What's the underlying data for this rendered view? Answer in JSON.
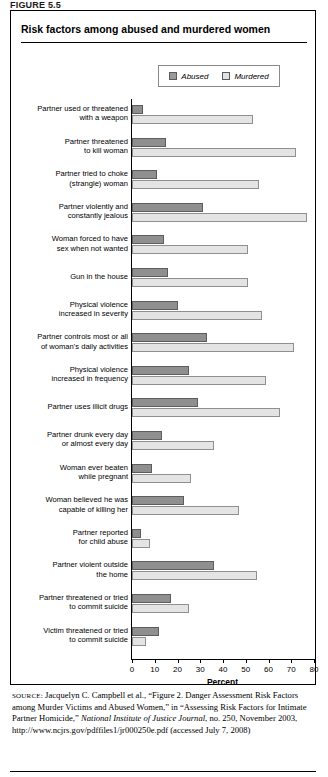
{
  "figure_label": "FIGURE 5.5",
  "title": "Risk factors among abused and murdered women",
  "legend": {
    "items": [
      {
        "label": "Abused",
        "color": "#8f8f8f",
        "name": "abused"
      },
      {
        "label": "Murdered",
        "color": "#e4e4e4",
        "name": "murdered"
      }
    ]
  },
  "source": {
    "prefix": "SOURCE:",
    "part1": " Jacquelyn C. Campbell et al., “Figure 2. Danger Assessment Risk Factors among Murder Victims and Abused Women,” in “Assessing Risk Factors for Intimate Partner Homicide,” ",
    "italic1": "National Institute of Justice Journal",
    "part2": ", no. 250, November 2003, http://www.ncjrs.gov/pdffiles1/jr000250e.pdf (accessed July 7, 2008)"
  },
  "chart_data": {
    "type": "bar",
    "orientation": "horizontal",
    "title": "Risk factors among abused and murdered women",
    "xlabel": "Percent",
    "ylabel": "",
    "xlim": [
      0,
      80
    ],
    "xticks": [
      0,
      10,
      20,
      30,
      40,
      50,
      60,
      70,
      80
    ],
    "grid": false,
    "legend_position": "top-right",
    "categories": [
      "Partner used or threatened with a weapon",
      "Partner threatened to kill woman",
      "Partner tried to choke (strangle) woman",
      "Partner violently and constantly jealous",
      "Woman forced to have sex when not wanted",
      "Gun in the house",
      "Physical violence increased in severity",
      "Partner controls most or all of woman's daily activities",
      "Physical violence increased in frequency",
      "Partner uses illicit drugs",
      "Partner drunk every day or almost every day",
      "Woman ever beaten while pregnant",
      "Woman believed he was capable of killing her",
      "Partner reported for child abuse",
      "Partner violent outside the home",
      "Partner threatened or tried to commit suicide",
      "Victim threatened or tried to commit suicide"
    ],
    "category_lines": [
      [
        "Partner used or threatened",
        "with a weapon"
      ],
      [
        "Partner threatened",
        "to kill woman"
      ],
      [
        "Partner tried to choke",
        "(strangle) woman"
      ],
      [
        "Partner violently and",
        "constantly jealous"
      ],
      [
        "Woman forced to have",
        "sex when not wanted"
      ],
      [
        "Gun in the house"
      ],
      [
        "Physical violence",
        "increased in severity"
      ],
      [
        "Partner controls most or all",
        "of woman's daily activities"
      ],
      [
        "Physical violence",
        "increased in frequency"
      ],
      [
        "Partner uses illicit drugs"
      ],
      [
        "Partner drunk every day",
        "or almost every day"
      ],
      [
        "Woman ever beaten",
        "while pregnant"
      ],
      [
        "Woman believed he was",
        "capable of killing her"
      ],
      [
        "Partner reported",
        "for child abuse"
      ],
      [
        "Partner violent outside",
        "the home"
      ],
      [
        "Partner threatened or tried",
        "to commit suicide"
      ],
      [
        "Victim threatened or tried",
        "to commit suicide"
      ]
    ],
    "series": [
      {
        "name": "Abused",
        "color": "#8f8f8f",
        "values": [
          5,
          15,
          11,
          31,
          14,
          16,
          20,
          33,
          25,
          29,
          13,
          9,
          23,
          4,
          36,
          17,
          12
        ]
      },
      {
        "name": "Murdered",
        "color": "#e4e4e4",
        "values": [
          53,
          72,
          56,
          77,
          51,
          51,
          57,
          71,
          59,
          65,
          36,
          26,
          47,
          8,
          55,
          25,
          6
        ]
      }
    ]
  }
}
